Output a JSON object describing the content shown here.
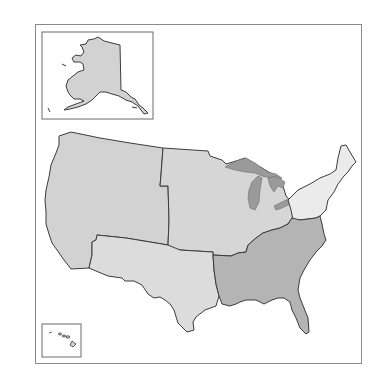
{
  "map": {
    "title": "",
    "regions": [
      {
        "id": "west",
        "name": "West",
        "fill": "#d2d2d2"
      },
      {
        "id": "midwest",
        "name": "Midwest",
        "fill": "#d6d6d6"
      },
      {
        "id": "southwest",
        "name": "Southwest",
        "fill": "#dcdcdc"
      },
      {
        "id": "southeast",
        "name": "Southeast",
        "fill": "#b4b4b4"
      },
      {
        "id": "northeast",
        "name": "Northeast",
        "fill": "#ebebeb"
      }
    ],
    "insets": [
      {
        "id": "alaska",
        "name": "Alaska",
        "fill": "#d2d2d2"
      },
      {
        "id": "hawaii",
        "name": "Hawaii",
        "fill": "#d2d2d2"
      }
    ],
    "lakes_color": "#9a9a9a",
    "border_color": "#8a8a8a"
  }
}
